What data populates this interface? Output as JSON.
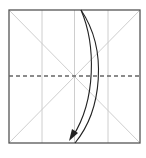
{
  "diagram": {
    "type": "origami-fold-step",
    "paper": {
      "x": 9,
      "y": 10,
      "size": 131,
      "border_color": "#555555",
      "crease_color": "#c8c8c8"
    },
    "creases": {
      "vertical_x": [
        42,
        74.5,
        108
      ],
      "diagonals": true
    },
    "valley_fold_line": {
      "y": 76,
      "style": "dashed",
      "color": "#666666"
    },
    "arrow": {
      "description": "fold top edge down to bottom edge",
      "color": "#222222"
    }
  }
}
